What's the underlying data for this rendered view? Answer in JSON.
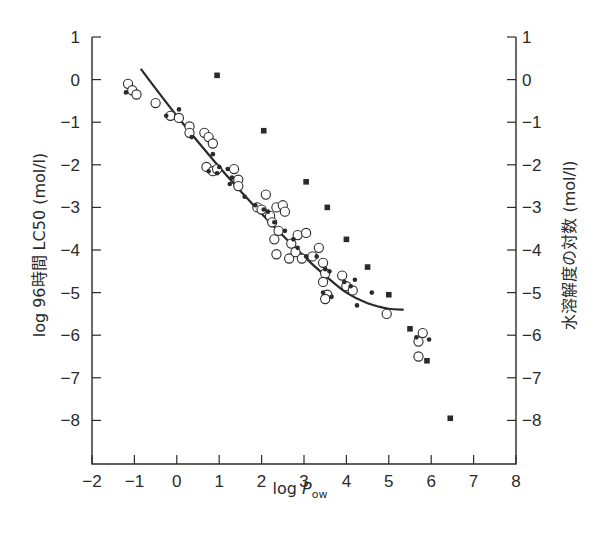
{
  "chart_data": {
    "type": "scatter",
    "title": "",
    "xlabel": "log P_ow",
    "xlabel_main": "log ",
    "xlabel_italic": "P",
    "xlabel_sub": "ow",
    "ylabel_left": "log 96時間 LC50 (mol/l)",
    "ylabel_right": "水溶解度の対数 (mol/l)",
    "xlim": [
      -2,
      8
    ],
    "ylim": [
      -9,
      1
    ],
    "x_ticks": [
      -2,
      -1,
      0,
      1,
      2,
      3,
      4,
      5,
      6,
      7,
      8
    ],
    "x_tick_labels": [
      "−2",
      "−1",
      "0",
      "1",
      "2",
      "3",
      "4",
      "5",
      "6",
      "7",
      "8"
    ],
    "y_ticks": [
      1,
      0,
      -1,
      -2,
      -3,
      -4,
      -5,
      -6,
      -7,
      -8
    ],
    "y_tick_labels": [
      "1",
      "0",
      "−1",
      "−2",
      "−3",
      "−4",
      "−5",
      "−6",
      "−7",
      "−8"
    ],
    "grid": false,
    "legend": "none",
    "series": [
      {
        "name": "LC50 (open circles)",
        "marker": "open-circle",
        "points": [
          [
            -1.15,
            -0.1
          ],
          [
            -1.05,
            -0.25
          ],
          [
            -0.95,
            -0.35
          ],
          [
            -0.5,
            -0.55
          ],
          [
            -0.15,
            -0.85
          ],
          [
            0.05,
            -0.9
          ],
          [
            0.3,
            -1.1
          ],
          [
            0.3,
            -1.25
          ],
          [
            0.65,
            -1.25
          ],
          [
            0.75,
            -1.35
          ],
          [
            0.85,
            -1.5
          ],
          [
            0.7,
            -2.05
          ],
          [
            0.85,
            -2.15
          ],
          [
            0.95,
            -2.1
          ],
          [
            1.35,
            -2.1
          ],
          [
            1.45,
            -2.35
          ],
          [
            1.45,
            -2.5
          ],
          [
            1.9,
            -3.0
          ],
          [
            2.0,
            -3.05
          ],
          [
            2.1,
            -2.7
          ],
          [
            2.2,
            -3.2
          ],
          [
            2.25,
            -3.35
          ],
          [
            2.35,
            -3.0
          ],
          [
            2.5,
            -2.95
          ],
          [
            2.55,
            -3.1
          ],
          [
            2.3,
            -3.75
          ],
          [
            2.4,
            -3.55
          ],
          [
            2.35,
            -4.1
          ],
          [
            2.7,
            -3.85
          ],
          [
            2.65,
            -4.2
          ],
          [
            2.8,
            -4.05
          ],
          [
            2.95,
            -4.2
          ],
          [
            2.85,
            -3.65
          ],
          [
            3.05,
            -3.6
          ],
          [
            3.2,
            -4.15
          ],
          [
            3.35,
            -3.95
          ],
          [
            3.45,
            -4.3
          ],
          [
            3.5,
            -4.55
          ],
          [
            3.45,
            -4.75
          ],
          [
            3.55,
            -5.05
          ],
          [
            3.5,
            -5.15
          ],
          [
            3.9,
            -4.6
          ],
          [
            4.0,
            -4.85
          ],
          [
            4.15,
            -4.95
          ],
          [
            4.95,
            -5.5
          ],
          [
            5.8,
            -5.95
          ],
          [
            5.7,
            -6.15
          ],
          [
            5.7,
            -6.5
          ]
        ]
      },
      {
        "name": "LC50 (filled dots)",
        "marker": "filled-dot",
        "points": [
          [
            -1.2,
            -0.3
          ],
          [
            -0.25,
            -0.85
          ],
          [
            0.05,
            -0.7
          ],
          [
            0.35,
            -1.35
          ],
          [
            0.85,
            -1.75
          ],
          [
            0.75,
            -2.15
          ],
          [
            0.95,
            -2.2
          ],
          [
            1.0,
            -2.05
          ],
          [
            1.2,
            -2.1
          ],
          [
            1.3,
            -2.3
          ],
          [
            1.25,
            -2.45
          ],
          [
            1.6,
            -2.75
          ],
          [
            1.85,
            -2.95
          ],
          [
            2.05,
            -3.05
          ],
          [
            2.15,
            -3.1
          ],
          [
            2.3,
            -3.35
          ],
          [
            2.55,
            -3.55
          ],
          [
            2.75,
            -3.75
          ],
          [
            2.85,
            -3.95
          ],
          [
            3.05,
            -4.15
          ],
          [
            3.3,
            -4.15
          ],
          [
            3.5,
            -4.45
          ],
          [
            3.6,
            -4.5
          ],
          [
            3.45,
            -5.0
          ],
          [
            3.65,
            -5.1
          ],
          [
            3.95,
            -4.75
          ],
          [
            4.1,
            -4.85
          ],
          [
            4.2,
            -4.7
          ],
          [
            4.25,
            -5.3
          ],
          [
            4.6,
            -5.0
          ],
          [
            5.65,
            -6.05
          ],
          [
            5.95,
            -6.1
          ]
        ]
      },
      {
        "name": "Water solubility (filled squares)",
        "marker": "filled-square",
        "points": [
          [
            0.95,
            0.1
          ],
          [
            2.05,
            -1.2
          ],
          [
            3.05,
            -2.4
          ],
          [
            3.55,
            -3.0
          ],
          [
            4.0,
            -3.75
          ],
          [
            4.5,
            -4.4
          ],
          [
            5.0,
            -5.05
          ],
          [
            5.5,
            -5.85
          ],
          [
            5.9,
            -6.6
          ],
          [
            6.45,
            -7.95
          ]
        ]
      }
    ],
    "fit_curve": {
      "name": "regression curve",
      "points": [
        [
          -0.85,
          0.25
        ],
        [
          0.0,
          -0.85
        ],
        [
          1.0,
          -2.05
        ],
        [
          2.0,
          -3.15
        ],
        [
          3.0,
          -4.15
        ],
        [
          3.5,
          -4.6
        ],
        [
          4.0,
          -5.0
        ],
        [
          4.5,
          -5.25
        ],
        [
          5.0,
          -5.38
        ],
        [
          5.35,
          -5.4
        ]
      ]
    }
  }
}
